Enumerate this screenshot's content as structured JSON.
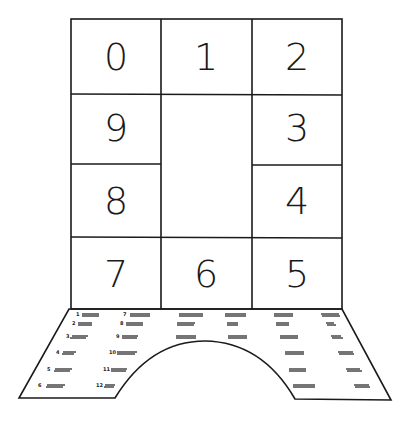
{
  "diagram": {
    "type": "number-board-foldout",
    "cells": [
      {
        "label": "0",
        "row": 0,
        "col": 0
      },
      {
        "label": "1",
        "row": 0,
        "col": 1
      },
      {
        "label": "2",
        "row": 0,
        "col": 2
      },
      {
        "label": "9",
        "row": 1,
        "col": 0
      },
      {
        "label": "3",
        "row": 1,
        "col": 2
      },
      {
        "label": "8",
        "row": 2,
        "col": 0
      },
      {
        "label": "4",
        "row": 2,
        "col": 2
      },
      {
        "label": "7",
        "row": 3,
        "col": 0
      },
      {
        "label": "6",
        "row": 3,
        "col": 1
      },
      {
        "label": "5",
        "row": 3,
        "col": 2
      }
    ],
    "center_empty": true,
    "base_panel": {
      "shape": "trapezoid-with-arch-cutout",
      "numbered_lines": [
        "1",
        "2",
        "3",
        "4",
        "5",
        "6",
        "7",
        "8",
        "9",
        "10",
        "11",
        "12"
      ]
    }
  },
  "colors": {
    "line": "#1a1a1a",
    "background": "#ffffff"
  }
}
